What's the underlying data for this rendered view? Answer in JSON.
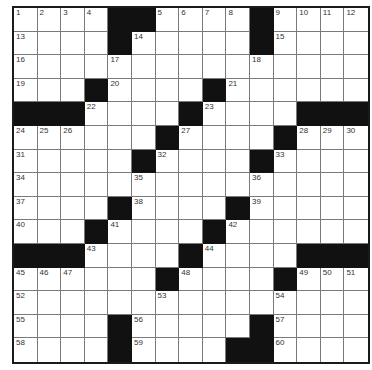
{
  "puzzle": {
    "size": 15,
    "layout": [
      "....##....#....",
      "....#.....#....",
      "...............",
      "...#....#......",
      "###....#....###",
      "......#....#...",
      ".....#....#....",
      "...............",
      "....#....#.....",
      "...#....#......",
      "###....#....###",
      "......#....#...",
      "...............",
      "....#.....#....",
      "....#....##...."
    ],
    "numbers": [
      {
        "n": 1,
        "r": 0,
        "c": 0
      },
      {
        "n": 2,
        "r": 0,
        "c": 1
      },
      {
        "n": 3,
        "r": 0,
        "c": 2
      },
      {
        "n": 4,
        "r": 0,
        "c": 3
      },
      {
        "n": 5,
        "r": 0,
        "c": 6
      },
      {
        "n": 6,
        "r": 0,
        "c": 7
      },
      {
        "n": 7,
        "r": 0,
        "c": 8
      },
      {
        "n": 8,
        "r": 0,
        "c": 9
      },
      {
        "n": 9,
        "r": 0,
        "c": 11
      },
      {
        "n": 10,
        "r": 0,
        "c": 12
      },
      {
        "n": 11,
        "r": 0,
        "c": 13
      },
      {
        "n": 12,
        "r": 0,
        "c": 14
      },
      {
        "n": 13,
        "r": 1,
        "c": 0
      },
      {
        "n": 14,
        "r": 1,
        "c": 5
      },
      {
        "n": 15,
        "r": 1,
        "c": 11
      },
      {
        "n": 16,
        "r": 2,
        "c": 0
      },
      {
        "n": 17,
        "r": 2,
        "c": 4
      },
      {
        "n": 18,
        "r": 2,
        "c": 10
      },
      {
        "n": 19,
        "r": 3,
        "c": 0
      },
      {
        "n": 20,
        "r": 3,
        "c": 4
      },
      {
        "n": 21,
        "r": 3,
        "c": 9
      },
      {
        "n": 22,
        "r": 4,
        "c": 3
      },
      {
        "n": 23,
        "r": 4,
        "c": 8
      },
      {
        "n": 24,
        "r": 5,
        "c": 0
      },
      {
        "n": 25,
        "r": 5,
        "c": 1
      },
      {
        "n": 26,
        "r": 5,
        "c": 2
      },
      {
        "n": 27,
        "r": 5,
        "c": 7
      },
      {
        "n": 28,
        "r": 5,
        "c": 12
      },
      {
        "n": 29,
        "r": 5,
        "c": 13
      },
      {
        "n": 30,
        "r": 5,
        "c": 14
      },
      {
        "n": 31,
        "r": 6,
        "c": 0
      },
      {
        "n": 32,
        "r": 6,
        "c": 6
      },
      {
        "n": 33,
        "r": 6,
        "c": 11
      },
      {
        "n": 34,
        "r": 7,
        "c": 0
      },
      {
        "n": 35,
        "r": 7,
        "c": 5
      },
      {
        "n": 36,
        "r": 7,
        "c": 10
      },
      {
        "n": 37,
        "r": 8,
        "c": 0
      },
      {
        "n": 38,
        "r": 8,
        "c": 5
      },
      {
        "n": 39,
        "r": 8,
        "c": 10
      },
      {
        "n": 40,
        "r": 9,
        "c": 0
      },
      {
        "n": 41,
        "r": 9,
        "c": 4
      },
      {
        "n": 42,
        "r": 9,
        "c": 9
      },
      {
        "n": 43,
        "r": 10,
        "c": 3
      },
      {
        "n": 44,
        "r": 10,
        "c": 8
      },
      {
        "n": 45,
        "r": 11,
        "c": 0
      },
      {
        "n": 46,
        "r": 11,
        "c": 1
      },
      {
        "n": 47,
        "r": 11,
        "c": 2
      },
      {
        "n": 48,
        "r": 11,
        "c": 7
      },
      {
        "n": 49,
        "r": 11,
        "c": 12
      },
      {
        "n": 50,
        "r": 11,
        "c": 13
      },
      {
        "n": 51,
        "r": 11,
        "c": 14
      },
      {
        "n": 52,
        "r": 12,
        "c": 0
      },
      {
        "n": 53,
        "r": 12,
        "c": 6
      },
      {
        "n": 54,
        "r": 12,
        "c": 11
      },
      {
        "n": 55,
        "r": 13,
        "c": 0
      },
      {
        "n": 56,
        "r": 13,
        "c": 5
      },
      {
        "n": 57,
        "r": 13,
        "c": 11
      },
      {
        "n": 58,
        "r": 14,
        "c": 0
      },
      {
        "n": 59,
        "r": 14,
        "c": 5
      },
      {
        "n": 60,
        "r": 14,
        "c": 11
      }
    ],
    "colors": {
      "block": "#111111",
      "cell": "#ffffff",
      "gridline": "#7a7a7a",
      "border": "#1a1a1a",
      "number": "#333333"
    }
  }
}
